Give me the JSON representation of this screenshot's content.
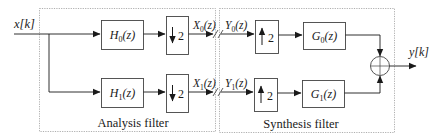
{
  "colors": {
    "line": "#1a1a1a",
    "box_border": "#444444",
    "region_border": "#9a9a9a",
    "background": "#ffffff"
  },
  "input": {
    "label": "x[k]"
  },
  "output": {
    "label": "y[k]"
  },
  "analysis": {
    "title": "Analysis filter",
    "filters": [
      {
        "name": "H",
        "sub": "0",
        "arg": "(z)"
      },
      {
        "name": "H",
        "sub": "1",
        "arg": "(z)"
      }
    ],
    "downsamplers": [
      {
        "arrow": "↓",
        "factor": "2"
      },
      {
        "arrow": "↓",
        "factor": "2"
      }
    ],
    "outputs": [
      {
        "name": "X",
        "sub": "0",
        "arg": "(z)"
      },
      {
        "name": "X",
        "sub": "1",
        "arg": "(z)"
      }
    ]
  },
  "synthesis": {
    "title": "Synthesis filter",
    "inputs": [
      {
        "name": "Y",
        "sub": "0",
        "arg": "(z)"
      },
      {
        "name": "Y",
        "sub": "1",
        "arg": "(z)"
      }
    ],
    "upsamplers": [
      {
        "arrow": "↑",
        "factor": "2"
      },
      {
        "arrow": "↑",
        "factor": "2"
      }
    ],
    "filters": [
      {
        "name": "G",
        "sub": "0",
        "arg": "(z)"
      },
      {
        "name": "G",
        "sub": "1",
        "arg": "(z)"
      }
    ]
  },
  "adder": {
    "symbol": "+"
  }
}
